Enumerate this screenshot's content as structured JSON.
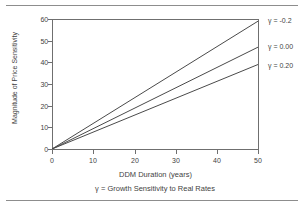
{
  "chart_data": {
    "type": "line",
    "title": "",
    "subtitle": "γ = Growth Sensitivity to Real Rates",
    "xlabel": "DDM Duration (years)",
    "ylabel": "Magnitude of Price Sensitivity",
    "xlim": [
      0,
      50
    ],
    "ylim": [
      0,
      60
    ],
    "xticks": [
      0,
      10,
      20,
      30,
      40,
      50
    ],
    "yticks": [
      0,
      10,
      20,
      30,
      40,
      50,
      60
    ],
    "xtick_labels": [
      "0",
      "10",
      "20",
      "30",
      "40",
      "50"
    ],
    "ytick_labels": [
      "0",
      "10",
      "20",
      "30",
      "40",
      "50",
      "60"
    ],
    "grid": false,
    "legend_position": "right",
    "x": [
      0,
      50
    ],
    "series": [
      {
        "name": "γ = -0.2",
        "values": [
          0,
          59
        ]
      },
      {
        "name": "γ = 0.00",
        "values": [
          0,
          47
        ]
      },
      {
        "name": "γ = 0.20",
        "values": [
          0,
          39
        ]
      }
    ]
  },
  "legend": {
    "items": [
      {
        "label": "γ = -0.2"
      },
      {
        "label": "γ = 0.00"
      },
      {
        "label": "γ = 0.20"
      }
    ]
  },
  "colors": {
    "line": "#4a4a4a",
    "axis": "#6f6f6f",
    "text": "#3f3f3f",
    "rule": "#8d8d8d"
  }
}
